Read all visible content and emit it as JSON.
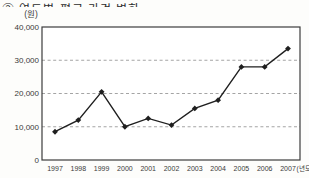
{
  "chart": {
    "title_clipped": "② 연도별 평균 가격 변화"
  },
  "chart_data": {
    "type": "line",
    "title": "",
    "categories": [
      "1997",
      "1998",
      "1999",
      "2000",
      "2001",
      "2002",
      "2003",
      "2004",
      "2005",
      "2006",
      "2007"
    ],
    "values": [
      8500,
      12000,
      20500,
      10000,
      12500,
      10500,
      15500,
      18000,
      28000,
      28000,
      33500
    ],
    "series_name": "가격",
    "xlabel": "",
    "ylabel": "",
    "y_unit_label": "(원)",
    "x_unit_label": "(년도)",
    "ylim": [
      0,
      40000
    ],
    "yticks": [
      0,
      10000,
      20000,
      30000,
      40000
    ],
    "ytick_labels": [
      "0",
      "10,000",
      "20,000",
      "30,000",
      "40,000"
    ],
    "grid": "horizontal dashed at 10000, 20000, 30000",
    "legend": "none",
    "marker": "diamond",
    "line_color": "#1f1f1f",
    "grid_color": "#9a9a9a",
    "border_color": "#3c3c3c",
    "plot_bg": "#ffffff"
  }
}
